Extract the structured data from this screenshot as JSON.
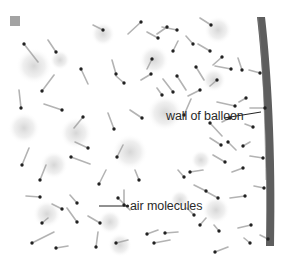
{
  "diagram": {
    "labels": {
      "wall": "wall of balloon",
      "molecules": "air molecules"
    },
    "colors": {
      "background": "#ffffff",
      "wall": "#5e5e5e",
      "molecule": "#222222",
      "trail": "#9a9a9a",
      "haze": "#d4d4d4",
      "marker": "#a3a3a3"
    },
    "molecules": [
      [
        24,
        44,
        38,
        62
      ],
      [
        56,
        52,
        48,
        40
      ],
      [
        42,
        91,
        54,
        75
      ],
      [
        21,
        108,
        19,
        90
      ],
      [
        62,
        110,
        44,
        104
      ],
      [
        83,
        117,
        74,
        128
      ],
      [
        81,
        69,
        88,
        84
      ],
      [
        114,
        129,
        108,
        113
      ],
      [
        103,
        30,
        93,
        25
      ],
      [
        141,
        22,
        128,
        34
      ],
      [
        177,
        30,
        162,
        27
      ],
      [
        158,
        38,
        147,
        32
      ],
      [
        173,
        51,
        178,
        41
      ],
      [
        152,
        59,
        147,
        69
      ],
      [
        116,
        74,
        112,
        60
      ],
      [
        151,
        74,
        141,
        80
      ],
      [
        124,
        83,
        116,
        76
      ],
      [
        177,
        76,
        186,
        90
      ],
      [
        167,
        27,
        157,
        34
      ],
      [
        193,
        44,
        186,
        36
      ],
      [
        211,
        25,
        200,
        18
      ],
      [
        210,
        51,
        198,
        44
      ],
      [
        222,
        57,
        213,
        65
      ],
      [
        196,
        67,
        204,
        80
      ],
      [
        242,
        70,
        238,
        58
      ],
      [
        231,
        69,
        215,
        66
      ],
      [
        260,
        73,
        249,
        70
      ],
      [
        217,
        80,
        210,
        86
      ],
      [
        246,
        98,
        239,
        102
      ],
      [
        235,
        106,
        217,
        102
      ],
      [
        265,
        108,
        250,
        108
      ],
      [
        200,
        90,
        188,
        96
      ],
      [
        173,
        92,
        163,
        79
      ],
      [
        184,
        115,
        191,
        99
      ],
      [
        162,
        95,
        157,
        88
      ],
      [
        142,
        118,
        130,
        110
      ],
      [
        40,
        180,
        46,
        165
      ],
      [
        88,
        148,
        75,
        142
      ],
      [
        117,
        157,
        123,
        145
      ],
      [
        71,
        157,
        90,
        164
      ],
      [
        22,
        165,
        29,
        148
      ],
      [
        40,
        197,
        26,
        196
      ],
      [
        77,
        203,
        70,
        195
      ],
      [
        118,
        198,
        130,
        210
      ],
      [
        42,
        223,
        48,
        218
      ],
      [
        77,
        222,
        67,
        208
      ],
      [
        99,
        184,
        106,
        170
      ],
      [
        62,
        209,
        52,
        204
      ],
      [
        100,
        223,
        88,
        216
      ],
      [
        32,
        243,
        54,
        232
      ],
      [
        56,
        248,
        68,
        246
      ],
      [
        96,
        247,
        98,
        232
      ],
      [
        124,
        205,
        124,
        190
      ],
      [
        116,
        243,
        128,
        240
      ],
      [
        147,
        234,
        158,
        230
      ],
      [
        139,
        180,
        135,
        170
      ],
      [
        154,
        243,
        170,
        240
      ],
      [
        200,
        225,
        206,
        218
      ],
      [
        206,
        191,
        194,
        185
      ],
      [
        219,
        231,
        214,
        225
      ],
      [
        184,
        177,
        178,
        170
      ],
      [
        245,
        196,
        230,
        198
      ],
      [
        218,
        198,
        207,
        192
      ],
      [
        194,
        215,
        187,
        208
      ],
      [
        165,
        233,
        178,
        232
      ],
      [
        215,
        252,
        228,
        247
      ],
      [
        251,
        225,
        238,
        228
      ],
      [
        243,
        168,
        232,
        172
      ],
      [
        250,
        243,
        244,
        238
      ],
      [
        263,
        158,
        250,
        156
      ],
      [
        190,
        172,
        203,
        170
      ],
      [
        225,
        162,
        213,
        155
      ],
      [
        228,
        142,
        236,
        150
      ],
      [
        268,
        239,
        260,
        235
      ],
      [
        264,
        188,
        254,
        186
      ],
      [
        221,
        145,
        210,
        138
      ],
      [
        210,
        123,
        222,
        136
      ],
      [
        253,
        127,
        245,
        124
      ],
      [
        230,
        118,
        222,
        122
      ],
      [
        243,
        146,
        250,
        142
      ]
    ],
    "haze_blobs": [
      [
        34,
        66,
        18
      ],
      [
        76,
        133,
        16
      ],
      [
        54,
        165,
        14
      ],
      [
        130,
        152,
        18
      ],
      [
        165,
        113,
        18
      ],
      [
        154,
        60,
        15
      ],
      [
        103,
        34,
        12
      ],
      [
        218,
        30,
        14
      ],
      [
        214,
        80,
        12
      ],
      [
        47,
        214,
        14
      ],
      [
        110,
        222,
        12
      ],
      [
        216,
        210,
        14
      ],
      [
        201,
        160,
        10
      ],
      [
        24,
        128,
        16
      ],
      [
        120,
        245,
        12
      ],
      [
        60,
        60,
        10
      ],
      [
        180,
        200,
        10
      ]
    ]
  }
}
